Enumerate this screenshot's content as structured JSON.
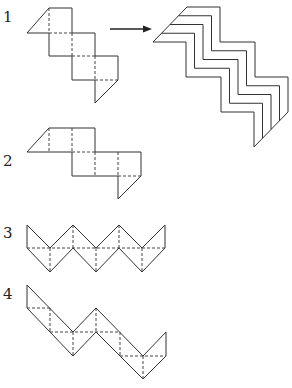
{
  "figures": [
    {
      "label": "1",
      "description": "Folding net of squares with triangular end caps, arranged diagonally (staircase)"
    },
    {
      "label": "2",
      "description": "Folding net, horizontal step pattern with triangular end caps"
    },
    {
      "label": "3",
      "description": "Zigzag net of triangles along a horizontal strip"
    },
    {
      "label": "4",
      "description": "Zigzag net of triangles descending diagonally"
    }
  ],
  "arrow": {
    "direction": "right",
    "meaning": "results in stacked zigzag folded form"
  },
  "result_figure": {
    "description": "Five nested staircase zigzag outlines",
    "line_count": 5
  },
  "colors": {
    "stroke": "#333333",
    "background": "#ffffff"
  }
}
